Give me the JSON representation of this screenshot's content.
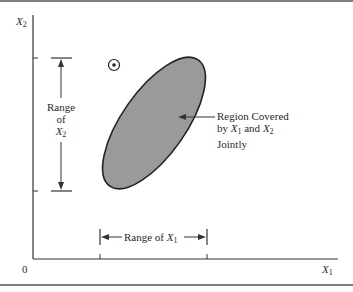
{
  "figure": {
    "axes": {
      "y_axis_label": "X",
      "y_axis_sub": "2",
      "x_axis_label": "X",
      "x_axis_sub": "1",
      "origin_label": "0"
    },
    "range_x2": {
      "line1": "Range",
      "line2": "of",
      "line3_var": "X",
      "line3_sub": "2"
    },
    "range_x1": {
      "text": "Range of ",
      "var": "X",
      "sub": "1"
    },
    "region_label": {
      "line1": "Region Covered",
      "line2_prefix": "by ",
      "line2_var1": "X",
      "line2_sub1": "1",
      "line2_mid": " and ",
      "line2_var2": "X",
      "line2_sub2": "2",
      "line3": "Jointly"
    },
    "colors": {
      "region_fill": "#9a9a9a",
      "stroke": "#2a2a2a",
      "border": "#555555"
    }
  }
}
